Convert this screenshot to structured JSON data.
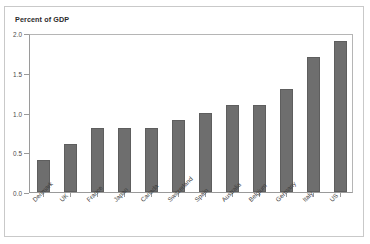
{
  "figure": {
    "title": "Percent of GDP",
    "top_strip_ghost_text": "",
    "frame_color": "#c9c9c9",
    "bar_color": "#6e6e6e",
    "axis_color": "#9a9a9a"
  },
  "chart_data": {
    "type": "bar",
    "title": "Percent of GDP",
    "xlabel": "",
    "ylabel": "Percent of GDP",
    "ylim": [
      0.0,
      2.0
    ],
    "yticks": [
      "0.0",
      "0.5",
      "1.0",
      "1.5",
      "2.0"
    ],
    "ytick_values": [
      0.0,
      0.5,
      1.0,
      1.5,
      2.0
    ],
    "grid": false,
    "legend": "none",
    "categories": [
      "Denmark",
      "UK",
      "France",
      "Japan",
      "Canada",
      "Switzerland",
      "Spain",
      "Australia",
      "Belgium",
      "Germany",
      "Italy",
      "US"
    ],
    "values": [
      0.4,
      0.6,
      0.8,
      0.8,
      0.8,
      0.9,
      1.0,
      1.1,
      1.1,
      1.3,
      1.7,
      1.9
    ]
  }
}
